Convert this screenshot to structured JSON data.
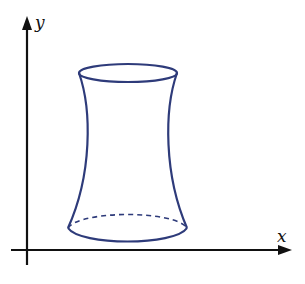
{
  "diagram": {
    "type": "hyperboloid-of-one-sheet",
    "axes": {
      "x_label": "x",
      "y_label": "y"
    },
    "colors": {
      "axis": "#111111",
      "surface": "#2e3b7a"
    }
  }
}
